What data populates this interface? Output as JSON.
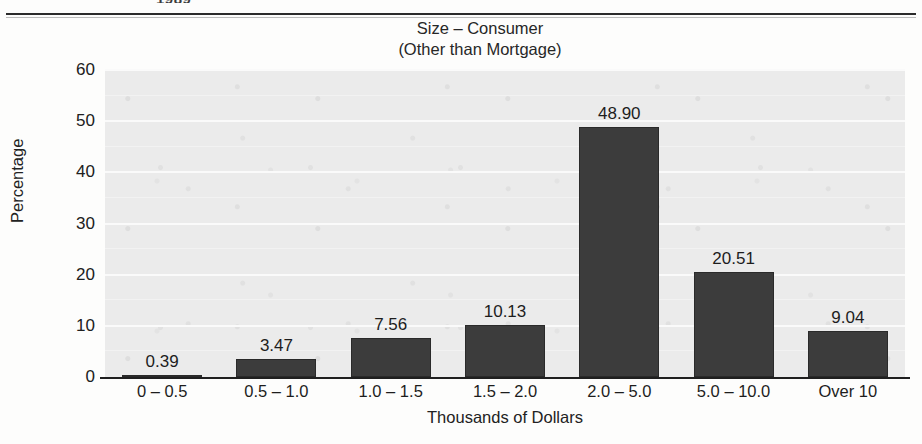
{
  "page": {
    "cropped_header_text": "1989",
    "background_color": "#fdfdfc"
  },
  "chart_data": {
    "type": "bar",
    "title": "Size – Consumer",
    "subtitle": "(Other than Mortgage)",
    "xlabel": "Thousands of Dollars",
    "ylabel": "Percentage",
    "categories": [
      "0 – 0.5",
      "0.5 – 1.0",
      "1.0 – 1.5",
      "1.5 – 2.0",
      "2.0 – 5.0",
      "5.0 – 10.0",
      "Over 10"
    ],
    "values": [
      0.39,
      3.47,
      7.56,
      10.13,
      48.9,
      20.51,
      9.04
    ],
    "value_labels": [
      "0.39",
      "3.47",
      "7.56",
      "10.13",
      "48.90",
      "20.51",
      "9.04"
    ],
    "ylim": [
      0,
      60
    ],
    "yticks": [
      0,
      10,
      20,
      30,
      40,
      50,
      60
    ],
    "ytick_labels": [
      "0",
      "10",
      "20",
      "30",
      "40",
      "50",
      "60"
    ],
    "grid": true,
    "legend": "none",
    "bar_color": "#3c3c3c",
    "plot_background_color": "#ebebeb",
    "gridline_color": "#fafafa",
    "axis_color": "#1f1f1f"
  }
}
